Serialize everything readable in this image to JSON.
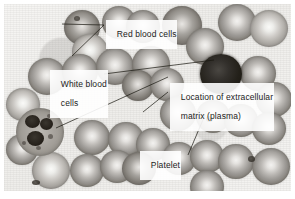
{
  "figure": {
    "name": "blood-smear-micrograph",
    "caption_present": false,
    "border_color": "#8a8780",
    "background_color": "#ffffff"
  },
  "annotations": [
    {
      "id": "red-blood-cells",
      "label": "Red blood cells",
      "lines": [
        "Red blood cells"
      ],
      "x": 106,
      "y": 20,
      "leaders": 2,
      "points_to": "two erythrocytes at upper left"
    },
    {
      "id": "white-blood-cells",
      "label": "White blood cells",
      "lines": [
        "White blood",
        "cells"
      ],
      "x": 50,
      "y": 70,
      "leaders": 2,
      "points_to": "dark lymphocyte upper right and granulocyte lower left"
    },
    {
      "id": "extracellular-matrix",
      "label": "Location of extracellular matrix (plasma)",
      "lines": [
        "Location of extracellular",
        "matrix (plasma)"
      ],
      "x": 170,
      "y": 83,
      "leaders": 1,
      "points_to": "clear fluid gap between cells"
    },
    {
      "id": "platelet",
      "label": "Platelet",
      "lines": [
        "Platelet"
      ],
      "x": 140,
      "y": 151,
      "leaders": 1,
      "points_to": "small dark speck between erythrocytes"
    }
  ],
  "specimen": {
    "type": "peripheral blood smear",
    "stain": "grayscale light micrograph",
    "cell_counts": {
      "red_blood_cells": 34,
      "white_blood_cells": 2,
      "platelets": 1
    }
  },
  "palette": {
    "rbc_rim": "#78746e",
    "rbc_center": "#f3f2f0",
    "lymphocyte": "#231f19",
    "granulocyte": "#9a968f",
    "plasma": "#f2f1ef",
    "label_text": "#1b1b1b",
    "leader_line": "#17150f"
  },
  "cells": {
    "red_blood_cells": [
      {
        "x": 24,
        "y": 54,
        "d": 38,
        "shade": "normal"
      },
      {
        "x": 60,
        "y": 6,
        "d": 36,
        "shade": "dk"
      },
      {
        "x": 68,
        "y": 30,
        "d": 36,
        "shade": "pale"
      },
      {
        "x": 98,
        "y": 2,
        "d": 34,
        "shade": "normal"
      },
      {
        "x": 122,
        "y": 6,
        "d": 34,
        "shade": "normal"
      },
      {
        "x": 58,
        "y": 50,
        "d": 36,
        "shade": "normal"
      },
      {
        "x": 92,
        "y": 44,
        "d": 38,
        "shade": "normal"
      },
      {
        "x": 128,
        "y": 42,
        "d": 38,
        "shade": "normal"
      },
      {
        "x": 158,
        "y": 2,
        "d": 40,
        "shade": "dk"
      },
      {
        "x": 182,
        "y": 24,
        "d": 38,
        "shade": "normal"
      },
      {
        "x": 214,
        "y": 0,
        "d": 38,
        "shade": "normal"
      },
      {
        "x": 246,
        "y": 6,
        "d": 38,
        "shade": "pale"
      },
      {
        "x": 118,
        "y": 66,
        "d": 32,
        "shade": "dk"
      },
      {
        "x": 146,
        "y": 64,
        "d": 34,
        "shade": "normal"
      },
      {
        "x": 236,
        "y": 52,
        "d": 36,
        "shade": "normal"
      },
      {
        "x": 252,
        "y": 78,
        "d": 36,
        "shade": "normal"
      },
      {
        "x": 2,
        "y": 84,
        "d": 34,
        "shade": "pale"
      },
      {
        "x": 156,
        "y": 92,
        "d": 36,
        "shade": "normal"
      },
      {
        "x": 192,
        "y": 96,
        "d": 34,
        "shade": "normal"
      },
      {
        "x": 220,
        "y": 100,
        "d": 34,
        "shade": "normal"
      },
      {
        "x": 248,
        "y": 108,
        "d": 34,
        "shade": "normal"
      },
      {
        "x": 70,
        "y": 116,
        "d": 36,
        "shade": "normal"
      },
      {
        "x": 104,
        "y": 118,
        "d": 36,
        "shade": "normal"
      },
      {
        "x": 132,
        "y": 124,
        "d": 34,
        "shade": "normal"
      },
      {
        "x": 2,
        "y": 130,
        "d": 32,
        "shade": "normal"
      },
      {
        "x": 28,
        "y": 148,
        "d": 38,
        "shade": "pale"
      },
      {
        "x": 66,
        "y": 150,
        "d": 34,
        "shade": "normal"
      },
      {
        "x": 96,
        "y": 146,
        "d": 34,
        "shade": "normal"
      },
      {
        "x": 118,
        "y": 148,
        "d": 34,
        "shade": "dk"
      },
      {
        "x": 158,
        "y": 138,
        "d": 34,
        "shade": "normal"
      },
      {
        "x": 186,
        "y": 136,
        "d": 34,
        "shade": "normal"
      },
      {
        "x": 214,
        "y": 140,
        "d": 36,
        "shade": "normal"
      },
      {
        "x": 248,
        "y": 144,
        "d": 38,
        "shade": "normal"
      },
      {
        "x": 186,
        "y": 166,
        "d": 34,
        "shade": "normal"
      }
    ]
  }
}
